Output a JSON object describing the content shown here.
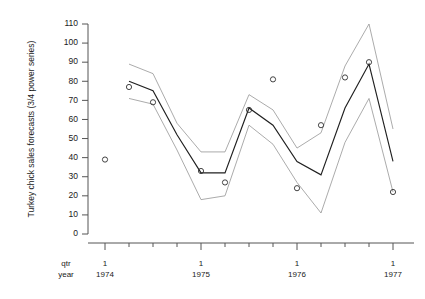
{
  "axes": {
    "y_title": "Turkey chick sales forecasts (3/4 power series)",
    "y_ticks": [
      0,
      10,
      20,
      30,
      40,
      50,
      60,
      70,
      80,
      90,
      100,
      110
    ],
    "y_min": 0,
    "y_max": 110,
    "row_label_qtr": "qtr",
    "row_label_year": "year",
    "x_groups": [
      {
        "qtr": "1",
        "year": "1974"
      },
      {
        "qtr": "1",
        "year": "1975"
      },
      {
        "qtr": "1",
        "year": "1976"
      },
      {
        "qtr": "1",
        "year": "1977"
      }
    ]
  },
  "chart_data": {
    "type": "line",
    "title": "",
    "xlabel": "",
    "ylabel": "Turkey chick sales forecasts (3/4 power series)",
    "ylim": [
      0,
      110
    ],
    "xlim": [
      1974.0,
      1977.0
    ],
    "grid": false,
    "legend": "none",
    "x": [
      1974.0,
      1974.25,
      1974.5,
      1974.75,
      1975.0,
      1975.25,
      1975.5,
      1975.75,
      1976.0,
      1976.25,
      1976.5,
      1976.75,
      1977.0
    ],
    "x_tick_labels": [
      "1 1974",
      "",
      "",
      "",
      "1 1975",
      "",
      "",
      "",
      "1 1976",
      "",
      "",
      "",
      "1 1977"
    ],
    "series": [
      {
        "name": "forecast",
        "style": "solid-dark",
        "values": [
          null,
          80,
          75,
          52,
          32,
          32,
          66,
          57,
          38,
          31,
          66,
          89,
          38
        ]
      },
      {
        "name": "upper bound",
        "style": "solid-light",
        "values": [
          null,
          89,
          84,
          58,
          43,
          43,
          73,
          65,
          45,
          53,
          88,
          110,
          55
        ]
      },
      {
        "name": "lower bound",
        "style": "solid-light",
        "values": [
          null,
          71,
          68,
          44,
          18,
          20,
          57,
          47,
          27,
          11,
          48,
          71,
          22
        ]
      },
      {
        "name": "observed",
        "style": "open-circles",
        "values": [
          39,
          77,
          69,
          null,
          33,
          27,
          65,
          81,
          24,
          57,
          82,
          90,
          22
        ]
      }
    ]
  },
  "geometry": {
    "plot_left": 96,
    "plot_right": 414,
    "plot_top": 24,
    "plot_bottom": 234,
    "x_per_quarter": 24,
    "x_origin_1974q1": 105
  }
}
